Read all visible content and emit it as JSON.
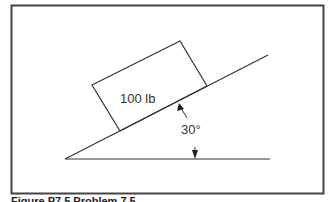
{
  "diagram": {
    "block_label": "100 lb",
    "angle_label": "30°",
    "caption": "Figure P7.5  Problem 7.5"
  },
  "colors": {
    "line": "#333333",
    "frame": "#444444",
    "text": "#333333",
    "background": "#ffffff"
  }
}
